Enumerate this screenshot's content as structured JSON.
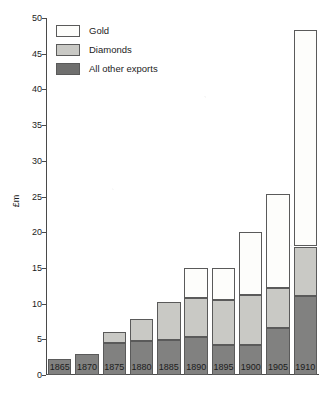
{
  "chart_data": {
    "type": "bar",
    "title": "",
    "subtitle": "",
    "xlabel": "",
    "ylabel": "£m",
    "ylim": [
      0,
      50
    ],
    "yticks": [
      0,
      5,
      10,
      15,
      20,
      25,
      30,
      35,
      40,
      45,
      50
    ],
    "grid": false,
    "stacked": true,
    "legend_position": "top-left",
    "categories": [
      "1865",
      "1870",
      "1875",
      "1880",
      "1885",
      "1890",
      "1895",
      "1900",
      "1905",
      "1910"
    ],
    "series": [
      {
        "name": "All other exports",
        "color": "#818180",
        "values": [
          2.3,
          3.0,
          4.5,
          4.7,
          4.9,
          5.3,
          4.2,
          4.2,
          6.6,
          11.0
        ]
      },
      {
        "name": "Diamonds",
        "color": "#c9c9c5",
        "values": [
          0.0,
          0.0,
          1.5,
          3.1,
          5.3,
          5.5,
          6.3,
          7.0,
          5.6,
          7.0
        ]
      },
      {
        "name": "Gold",
        "color": "#fdfdfb",
        "values": [
          0.0,
          0.0,
          0.0,
          0.0,
          0.0,
          4.2,
          4.5,
          8.8,
          13.1,
          30.3
        ]
      }
    ],
    "totals": [
      2.3,
      3.0,
      6.0,
      7.8,
      10.2,
      15.0,
      15.0,
      20.0,
      25.3,
      48.3
    ]
  },
  "legend": {
    "items": [
      {
        "label": "Gold",
        "key": "gold"
      },
      {
        "label": "Diamonds",
        "key": "diamonds"
      },
      {
        "label": "All other exports",
        "key": "other"
      }
    ]
  },
  "axes": {
    "y_axis_label": "£m"
  }
}
